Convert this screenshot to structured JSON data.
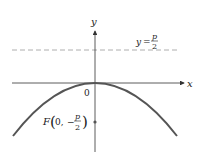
{
  "diagram": {
    "axes": {
      "x_label": "x",
      "y_label": "y",
      "origin_label": "0"
    },
    "directrix": {
      "label_lhs": "y",
      "label_eq": "=",
      "label_num": "p",
      "label_den": "2",
      "style": "dashed"
    },
    "focus": {
      "label_prefix": "F",
      "label_open": "(",
      "label_x": "0,",
      "label_minus": "−",
      "label_num": "p",
      "label_den": "2",
      "label_close": ")"
    },
    "colors": {
      "curve": "#555555",
      "axis": "#333333",
      "dashed": "#999999",
      "focus": "#555555"
    }
  }
}
